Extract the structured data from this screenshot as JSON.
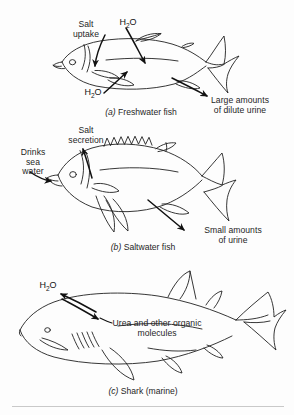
{
  "figure": {
    "panels": [
      {
        "id": "a",
        "caption_marker": "(a)",
        "caption_text": "Freshwater fish",
        "caption_full": "(a) Freshwater fish",
        "animal": "trout-shaped freshwater bony fish",
        "labels": [
          {
            "name": "salt-uptake",
            "lines": [
              "Salt",
              "uptake"
            ],
            "text": "Salt uptake"
          },
          {
            "name": "water-influx-top",
            "lines": [
              "H2O"
            ],
            "text": "H2O"
          },
          {
            "name": "water-influx-bottom",
            "lines": [
              "H2O"
            ],
            "text": "H2O"
          },
          {
            "name": "dilute-urine",
            "lines": [
              "Large amounts",
              "of dilute urine"
            ],
            "text": "Large amounts of dilute urine"
          }
        ]
      },
      {
        "id": "b",
        "caption_marker": "(b)",
        "caption_text": "Saltwater fish",
        "caption_full": "(b) Saltwater fish",
        "animal": "perch-shaped marine bony fish",
        "labels": [
          {
            "name": "salt-secretion",
            "lines": [
              "Salt",
              "secretion"
            ],
            "text": "Salt secretion"
          },
          {
            "name": "drinks-sea-water",
            "lines": [
              "Drinks",
              "sea",
              "water"
            ],
            "text": "Drinks sea water"
          },
          {
            "name": "concentrated-urine",
            "lines": [
              "Small amounts",
              "of urine"
            ],
            "text": "Small amounts of urine"
          }
        ]
      },
      {
        "id": "c",
        "caption_marker": "(c)",
        "caption_text": "Shark (marine)",
        "caption_full": "(c) Shark (marine)",
        "animal": "shark",
        "labels": [
          {
            "name": "water-movement",
            "lines": [
              "H2O"
            ],
            "text": "H2O"
          },
          {
            "name": "urea-retention",
            "lines": [
              "Urea and other organic",
              "molecules"
            ],
            "text": "Urea and other organic molecules"
          }
        ]
      }
    ]
  },
  "text": {
    "salt": "Salt",
    "uptake": "uptake",
    "secretion": "secretion",
    "drinks": "Drinks",
    "sea": "sea",
    "water": "water",
    "large_amounts": "Large amounts",
    "of_dilute_urine": "of dilute urine",
    "small_amounts": "Small amounts",
    "of_urine": "of urine",
    "urea_line1": "Urea and other organic",
    "urea_line2": "molecules",
    "cap_a_marker": "(a)",
    "cap_a_text": " Freshwater fish",
    "cap_b_marker": "(b)",
    "cap_b_text": " Saltwater fish",
    "cap_c_marker": "(c)",
    "cap_c_text": " Shark (marine)",
    "h2o_h": "H",
    "h2o_2": "2",
    "h2o_o": "O"
  },
  "colors": {
    "ink": "#1a1a1a",
    "outline": "#202020",
    "arrow": "#111111",
    "background": "#fdfdfd",
    "rule": "#c9c9c9"
  },
  "icons": {
    "arrow": "arrow-icon",
    "fish_outline": "fish-outline-icon",
    "shark_outline": "shark-outline-icon",
    "gill_slits": "gill-slits-icon",
    "eye": "eye-icon"
  }
}
